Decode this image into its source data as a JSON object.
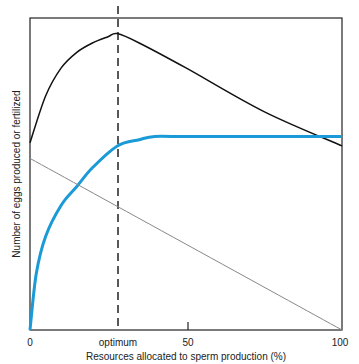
{
  "chart_data": {
    "type": "line",
    "title": "",
    "xlabel": "Resources allocated to sperm production (%)",
    "ylabel": "Number of eggs produced or fertilized",
    "xlim": [
      0,
      100
    ],
    "ylim": [
      0,
      100
    ],
    "x_ticks": [
      {
        "value": 0,
        "label": "0"
      },
      {
        "value": 28,
        "label": "optimum"
      },
      {
        "value": 50,
        "label": "50"
      },
      {
        "value": 100,
        "label": "100"
      }
    ],
    "annotations": [
      {
        "type": "vertical-dashed-line",
        "x": 28,
        "label": "optimum"
      }
    ],
    "grid": false,
    "series": [
      {
        "name": "Total (eggs produced + fertilized)",
        "color": "#111111",
        "x": [
          0,
          5,
          10,
          15,
          20,
          25,
          28,
          35,
          50,
          75,
          100
        ],
        "y": [
          60,
          75,
          84,
          89,
          92,
          94,
          95,
          92,
          84,
          70,
          59
        ]
      },
      {
        "name": "Eggs fertilized (sperm function)",
        "color": "#1a9ad6",
        "x": [
          0,
          2,
          5,
          10,
          15,
          20,
          28,
          35,
          40,
          50,
          100
        ],
        "y": [
          0,
          18,
          30,
          40,
          46,
          52,
          59,
          61,
          62,
          62,
          62
        ]
      },
      {
        "name": "Eggs produced (female function)",
        "color": "#888888",
        "x": [
          0,
          100
        ],
        "y": [
          55,
          0
        ]
      }
    ]
  }
}
